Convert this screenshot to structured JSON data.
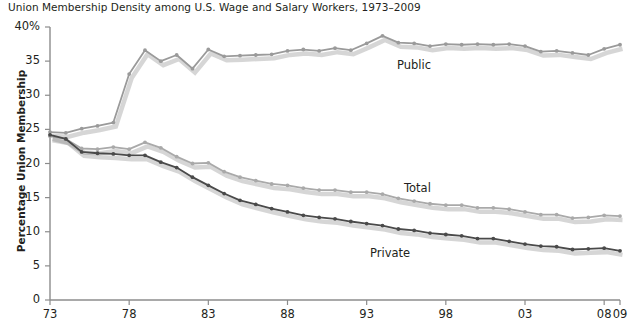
{
  "chart_data": {
    "type": "line",
    "title": "Union Membership Density among U.S. Wage and Salary Workers, 1973–2009",
    "xlabel": "",
    "ylabel": "Percentage Union Membership",
    "ylim": [
      0,
      40
    ],
    "xlim": [
      1973,
      2009
    ],
    "grid": false,
    "legend": "inline-annotations",
    "ytick_labels": [
      "0",
      "5",
      "10",
      "15",
      "20",
      "25",
      "30",
      "35",
      "40%"
    ],
    "ytick_values": [
      0,
      5,
      10,
      15,
      20,
      25,
      30,
      35,
      40
    ],
    "xtick_labels": [
      "73",
      "78",
      "83",
      "88",
      "93",
      "98",
      "03",
      "08",
      "09"
    ],
    "xtick_values": [
      1973,
      1978,
      1983,
      1988,
      1993,
      1998,
      2003,
      2008,
      2009
    ],
    "x": [
      1973,
      1974,
      1975,
      1976,
      1977,
      1978,
      1979,
      1980,
      1981,
      1982,
      1983,
      1984,
      1985,
      1986,
      1987,
      1988,
      1989,
      1990,
      1991,
      1992,
      1993,
      1994,
      1995,
      1996,
      1997,
      1998,
      1999,
      2000,
      2001,
      2002,
      2003,
      2004,
      2005,
      2006,
      2007,
      2008,
      2009
    ],
    "series": [
      {
        "name": "Public",
        "color": "#9a9a9a",
        "label_x": 397,
        "label_y": 58,
        "values": [
          24.6,
          24.5,
          25.1,
          25.5,
          26.0,
          33.1,
          36.6,
          35.0,
          35.9,
          33.9,
          36.7,
          35.7,
          35.8,
          35.9,
          36.0,
          36.5,
          36.7,
          36.5,
          36.9,
          36.6,
          37.6,
          38.7,
          37.7,
          37.6,
          37.2,
          37.5,
          37.4,
          37.5,
          37.4,
          37.5,
          37.2,
          36.4,
          36.5,
          36.2,
          35.9,
          36.8,
          37.4
        ]
      },
      {
        "name": "Total",
        "color": "#a9a9a9",
        "label_x": 404,
        "label_y": 181,
        "values": [
          24.0,
          23.6,
          22.2,
          22.1,
          22.4,
          22.1,
          23.1,
          22.3,
          21.0,
          20.0,
          20.1,
          18.8,
          18.0,
          17.5,
          17.0,
          16.8,
          16.4,
          16.1,
          16.1,
          15.8,
          15.8,
          15.5,
          14.9,
          14.5,
          14.1,
          13.9,
          13.9,
          13.5,
          13.5,
          13.3,
          12.9,
          12.5,
          12.5,
          12.0,
          12.1,
          12.4,
          12.3
        ]
      },
      {
        "name": "Private",
        "color": "#4a4a4a",
        "label_x": 370,
        "label_y": 246,
        "values": [
          24.2,
          23.6,
          21.7,
          21.5,
          21.4,
          21.2,
          21.2,
          20.2,
          19.4,
          18.0,
          16.8,
          15.6,
          14.6,
          14.0,
          13.4,
          12.9,
          12.4,
          12.1,
          11.9,
          11.5,
          11.2,
          10.9,
          10.4,
          10.2,
          9.8,
          9.6,
          9.4,
          9.0,
          9.0,
          8.6,
          8.2,
          7.9,
          7.8,
          7.4,
          7.5,
          7.6,
          7.2
        ]
      }
    ]
  },
  "axis": {
    "y_title": "Percentage Union Membership"
  }
}
